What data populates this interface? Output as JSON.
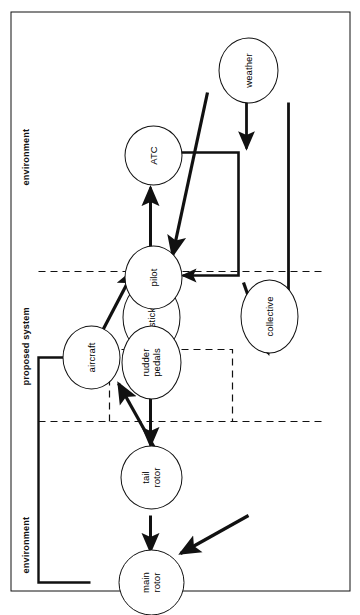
{
  "figure": {
    "kind": "system-context-diagram",
    "line_color": "#111111",
    "node_fill": "#ffffff",
    "zones": [
      {
        "id": "zone-top",
        "label": "environment"
      },
      {
        "id": "zone-middle",
        "label": "proposed system"
      },
      {
        "id": "zone-bottom",
        "label": "environment"
      }
    ],
    "nodes": [
      {
        "id": "main-rotor",
        "label": "main\nrotor",
        "line1": "main",
        "line2": "rotor"
      },
      {
        "id": "tail-rotor",
        "label": "tail\nrotor",
        "line1": "tail",
        "line2": "rotor"
      },
      {
        "id": "collective",
        "label": "collective",
        "line1": "collective",
        "line2": ""
      },
      {
        "id": "stick",
        "label": "stick",
        "line1": "stick",
        "line2": ""
      },
      {
        "id": "rudder-pedals",
        "label": "rudder\npedals",
        "line1": "rudder",
        "line2": "pedals"
      },
      {
        "id": "aircraft",
        "label": "aircraft",
        "line1": "aircraft",
        "line2": ""
      },
      {
        "id": "pilot",
        "label": "pilot",
        "line1": "pilot",
        "line2": ""
      },
      {
        "id": "atc",
        "label": "ATC",
        "line1": "ATC",
        "line2": ""
      },
      {
        "id": "weather",
        "label": "weather",
        "line1": "weather",
        "line2": ""
      }
    ],
    "edges": [
      {
        "id": "edge-collective-main-rotor",
        "from": "collective",
        "to": "main-rotor",
        "style": "diagonal"
      },
      {
        "id": "edge-stick-main-rotor",
        "from": "stick",
        "to": "main-rotor",
        "style": "straight"
      },
      {
        "id": "edge-main-rotor-aircraft",
        "from": "main-rotor",
        "to": "aircraft",
        "style": "orthogonal"
      },
      {
        "id": "edge-rudder-pedals-tail-rotor",
        "from": "rudder-pedals",
        "to": "tail-rotor",
        "style": "straight"
      },
      {
        "id": "edge-tail-rotor-aircraft",
        "from": "tail-rotor",
        "to": "aircraft",
        "style": "diagonal"
      },
      {
        "id": "edge-pilot-collective",
        "from": "pilot",
        "to": "collective",
        "style": "diagonal"
      },
      {
        "id": "edge-pilot-stick",
        "from": "pilot",
        "to": "stick",
        "style": "straight"
      },
      {
        "id": "edge-pilot-rudder-pedals",
        "from": "pilot",
        "to": "rudder-pedals",
        "style": "diagonal"
      },
      {
        "id": "edge-aircraft-pilot",
        "from": "aircraft",
        "to": "pilot",
        "style": "diagonal"
      },
      {
        "id": "edge-pilot-atc",
        "from": "pilot",
        "to": "atc",
        "style": "straight"
      },
      {
        "id": "edge-atc-pilot",
        "from": "atc",
        "to": "pilot",
        "style": "orthogonal"
      },
      {
        "id": "edge-weather-pilot",
        "from": "weather",
        "to": "pilot",
        "style": "diagonal"
      },
      {
        "id": "edge-weather-atc",
        "from": "weather",
        "to": "atc",
        "style": "straight"
      },
      {
        "id": "edge-weather-aircraft",
        "from": "weather",
        "to": "aircraft",
        "style": "straight"
      }
    ]
  }
}
